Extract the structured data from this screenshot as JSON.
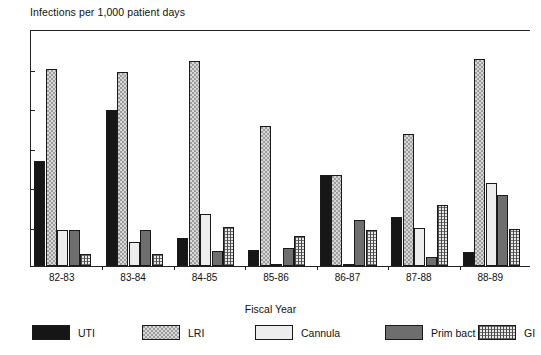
{
  "chart_data": {
    "type": "bar",
    "title": "Infections per 1,000 patient days",
    "xlabel": "Fiscal Year",
    "ylabel": "Infections per 1,000 patient days",
    "ylim": [
      0,
      12
    ],
    "yticks": [
      0,
      2,
      4,
      6,
      8,
      10,
      12
    ],
    "ytick_labels": [
      "0",
      "2",
      "4",
      "6",
      "8",
      "10",
      "12"
    ],
    "grid": false,
    "legend_position": "bottom",
    "categories": [
      "82-83",
      "83-84",
      "84-85",
      "85-86",
      "86-87",
      "87-88",
      "88-89"
    ],
    "series": [
      {
        "name": "UTI",
        "color": "#161616",
        "pattern": "solid-black",
        "values": [
          5.3,
          7.9,
          1.4,
          0.8,
          4.6,
          2.5,
          0.7
        ]
      },
      {
        "name": "LRI",
        "color": "#9d9d9d",
        "pattern": "checker",
        "values": [
          10.0,
          9.8,
          10.4,
          7.1,
          4.6,
          6.7,
          10.5
        ]
      },
      {
        "name": "Cannula",
        "color": "#ededed",
        "pattern": "light-solid",
        "values": [
          1.8,
          1.2,
          2.65,
          0.1,
          0.1,
          1.95,
          4.2
        ]
      },
      {
        "name": "Prim bact",
        "color": "#6e6e6e",
        "pattern": "dark-solid",
        "values": [
          1.8,
          1.8,
          0.75,
          0.9,
          2.35,
          0.45,
          3.6
        ]
      },
      {
        "name": "GI",
        "color": "#e9e9e9",
        "pattern": "grid",
        "values": [
          0.6,
          0.6,
          2.0,
          1.5,
          1.8,
          3.1,
          1.85
        ]
      }
    ]
  },
  "legend": {
    "items": [
      {
        "label": "UTI",
        "swatch": "swatch-uti"
      },
      {
        "label": "LRI",
        "swatch": "swatch-lri"
      },
      {
        "label": "Cannula",
        "swatch": "swatch-cannula"
      },
      {
        "label": "Prim bact",
        "swatch": "swatch-prim-bact"
      },
      {
        "label": "GI",
        "swatch": "swatch-gi"
      }
    ]
  }
}
